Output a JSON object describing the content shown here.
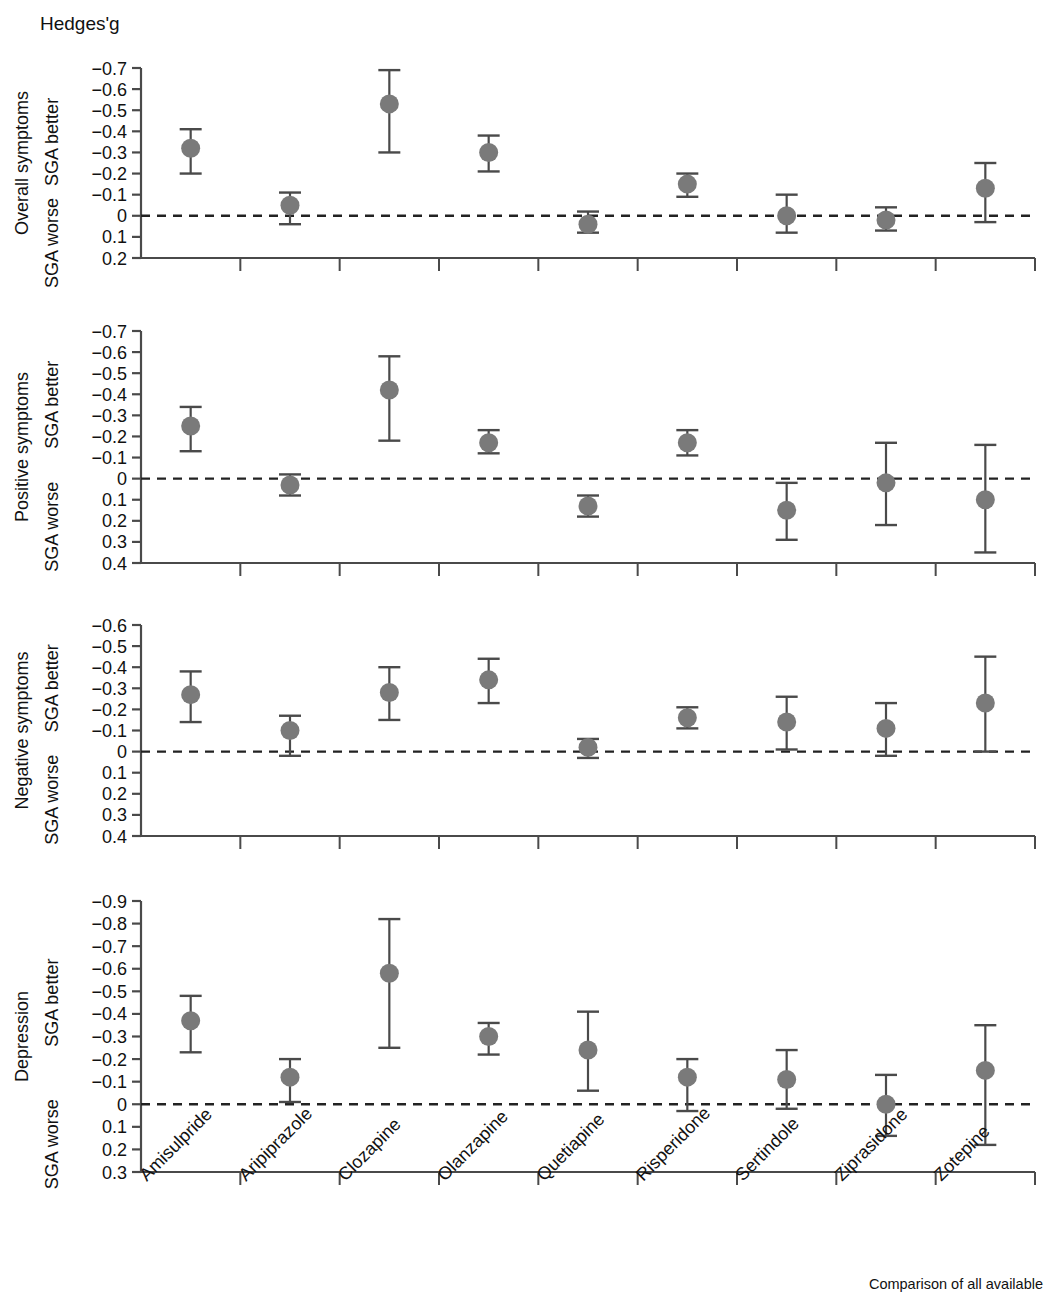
{
  "figure": {
    "y_axis_title": "Hedges'g",
    "better_label": "SGA better",
    "worse_label": "SGA worse",
    "marker_color": "#7a7a7a",
    "line_color": "#4a4a4a",
    "axis_color": "#4a4a4a",
    "zero_line_style": "dashed"
  },
  "categories": [
    "Amisulpride",
    "Aripiprazole",
    "Clozapine",
    "Olanzapine",
    "Quetiapine",
    "Risperidone",
    "Sertindole",
    "Ziprasidone",
    "Zotepine"
  ],
  "caption": "Comparison of all available",
  "chart_data": [
    {
      "type": "scatter",
      "title": "Overall symptoms",
      "ylabel": "Overall symptoms",
      "xlabel": "",
      "ylim": [
        -0.7,
        0.2
      ],
      "yticks": [
        -0.7,
        -0.6,
        -0.5,
        -0.4,
        -0.3,
        -0.2,
        -0.1,
        0,
        0.1,
        0.2
      ],
      "ytick_labels": [
        "−0.7",
        "−0.6",
        "−0.5",
        "−0.4",
        "−0.3",
        "−0.2",
        "−0.1",
        "0",
        "0.1",
        "0.2"
      ],
      "y_inverted": true,
      "grid": false,
      "reference_line": 0,
      "categories": [
        "Amisulpride",
        "Aripiprazole",
        "Clozapine",
        "Olanzapine",
        "Quetiapine",
        "Risperidone",
        "Sertindole",
        "Ziprasidone",
        "Zotepine"
      ],
      "values": [
        -0.32,
        -0.05,
        -0.53,
        -0.3,
        0.04,
        -0.15,
        0.0,
        0.02,
        -0.13
      ],
      "ci_lower": [
        -0.41,
        -0.11,
        -0.69,
        -0.38,
        -0.02,
        -0.2,
        -0.1,
        -0.04,
        -0.25
      ],
      "ci_upper": [
        -0.2,
        0.04,
        -0.3,
        -0.21,
        0.08,
        -0.09,
        0.08,
        0.07,
        0.03
      ]
    },
    {
      "type": "scatter",
      "title": "Positive symptoms",
      "ylabel": "Positive symptoms",
      "xlabel": "",
      "ylim": [
        -0.7,
        0.4
      ],
      "yticks": [
        -0.7,
        -0.6,
        -0.5,
        -0.4,
        -0.3,
        -0.2,
        -0.1,
        0,
        0.1,
        0.2,
        0.3,
        0.4
      ],
      "ytick_labels": [
        "−0.7",
        "−0.6",
        "−0.5",
        "−0.4",
        "−0.3",
        "−0.2",
        "−0.1",
        "0",
        "0.1",
        "0.2",
        "0.3",
        "0.4"
      ],
      "y_inverted": true,
      "grid": false,
      "reference_line": 0,
      "categories": [
        "Amisulpride",
        "Aripiprazole",
        "Clozapine",
        "Olanzapine",
        "Quetiapine",
        "Risperidone",
        "Sertindole",
        "Ziprasidone",
        "Zotepine"
      ],
      "values": [
        -0.25,
        0.03,
        -0.42,
        -0.17,
        0.13,
        -0.17,
        0.15,
        0.02,
        0.1
      ],
      "ci_lower": [
        -0.34,
        -0.02,
        -0.58,
        -0.23,
        0.08,
        -0.23,
        0.29,
        0.22,
        0.35
      ],
      "ci_upper": [
        -0.13,
        0.08,
        -0.18,
        -0.12,
        0.18,
        -0.11,
        0.02,
        -0.17,
        -0.16
      ]
    },
    {
      "type": "scatter",
      "title": "Negative symptoms",
      "ylabel": "Negative symptoms",
      "xlabel": "",
      "ylim": [
        -0.6,
        0.4
      ],
      "yticks": [
        -0.6,
        -0.5,
        -0.4,
        -0.3,
        -0.2,
        -0.1,
        0,
        0.1,
        0.2,
        0.3,
        0.4
      ],
      "ytick_labels": [
        "−0.6",
        "−0.5",
        "−0.4",
        "−0.3",
        "−0.2",
        "−0.1",
        "0",
        "0.1",
        "0.2",
        "0.3",
        "0.4"
      ],
      "y_inverted": true,
      "grid": false,
      "reference_line": 0,
      "categories": [
        "Amisulpride",
        "Aripiprazole",
        "Clozapine",
        "Olanzapine",
        "Quetiapine",
        "Risperidone",
        "Sertindole",
        "Ziprasidone",
        "Zotepine"
      ],
      "values": [
        -0.27,
        -0.1,
        -0.28,
        -0.34,
        -0.02,
        -0.16,
        -0.14,
        -0.11,
        -0.23
      ],
      "ci_lower": [
        -0.38,
        -0.17,
        -0.4,
        -0.44,
        -0.06,
        -0.21,
        -0.26,
        -0.23,
        -0.45
      ],
      "ci_upper": [
        -0.14,
        0.02,
        -0.15,
        -0.23,
        0.03,
        -0.11,
        -0.01,
        0.02,
        0.0
      ]
    },
    {
      "type": "scatter",
      "title": "Depression",
      "ylabel": "Depression",
      "xlabel": "",
      "ylim": [
        -0.9,
        0.3
      ],
      "yticks": [
        -0.9,
        -0.8,
        -0.7,
        -0.6,
        -0.5,
        -0.4,
        -0.3,
        -0.2,
        -0.1,
        0,
        0.1,
        0.2,
        0.3
      ],
      "ytick_labels": [
        "−0.9",
        "−0.8",
        "−0.7",
        "−0.6",
        "−0.5",
        "−0.4",
        "−0.3",
        "−0.2",
        "−0.1",
        "0",
        "0.1",
        "0.2",
        "0.3"
      ],
      "y_inverted": true,
      "grid": false,
      "reference_line": 0,
      "categories": [
        "Amisulpride",
        "Aripiprazole",
        "Clozapine",
        "Olanzapine",
        "Quetiapine",
        "Risperidone",
        "Sertindole",
        "Ziprasidone",
        "Zotepine"
      ],
      "values": [
        -0.37,
        -0.12,
        -0.58,
        -0.3,
        -0.24,
        -0.12,
        -0.11,
        0.0,
        -0.15
      ],
      "ci_lower": [
        -0.48,
        -0.2,
        -0.82,
        -0.36,
        -0.41,
        -0.2,
        -0.24,
        -0.13,
        -0.35
      ],
      "ci_upper": [
        -0.23,
        -0.01,
        -0.25,
        -0.22,
        -0.06,
        0.03,
        0.02,
        0.14,
        0.18
      ]
    }
  ]
}
